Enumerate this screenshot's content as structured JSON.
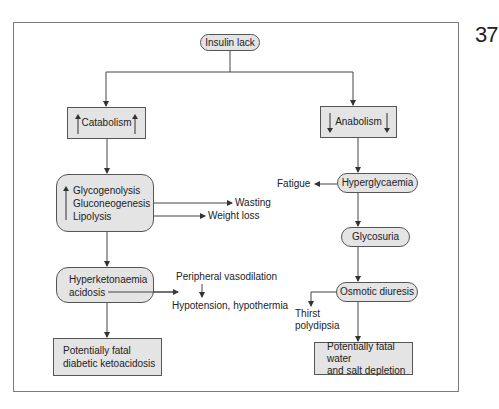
{
  "page_number": "37",
  "nodes": {
    "insulin_lack": "Insulin lack",
    "catabolism": "Catabolism",
    "anabolism": "Anabolism",
    "catabolic_processes": [
      "Glycogenolysis",
      "Gluconeogenesis",
      "Lipolysis"
    ],
    "hyperketonaemia": [
      "Hyperketonaemia",
      "acidosis"
    ],
    "fatal_dka": [
      "Potentially fatal",
      "diabetic ketoacidosis"
    ],
    "hyperglycaemia": "Hyperglycaemia",
    "glycosuria": "Glycosuria",
    "osmotic_diuresis": "Osmotic diuresis",
    "fatal_water": [
      "Potentially fatal water",
      "and salt depletion"
    ]
  },
  "labels": {
    "wasting": "Wasting",
    "weight_loss": "Weight loss",
    "peripheral_vasodilation": "Peripheral vasodilation",
    "hypotension": "Hypotension, hypothermia",
    "fatigue": "Fatigue",
    "thirst": "Thirst",
    "polydipsia": "polydipsia"
  },
  "colors": {
    "node_fill": "#e4e4e4",
    "line": "#333333",
    "frame": "#7a7a7a"
  }
}
